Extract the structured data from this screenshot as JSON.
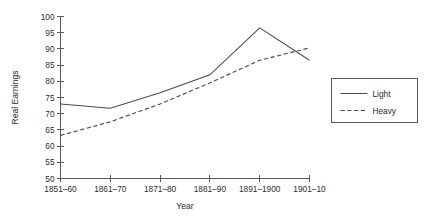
{
  "chart_data": {
    "type": "line",
    "title": "",
    "xlabel": "Year",
    "ylabel": "Real Earnings",
    "categories": [
      "1851–60",
      "1861–70",
      "1871–80",
      "1881–90",
      "1891–1900",
      "1901–10"
    ],
    "ylim": [
      50,
      100
    ],
    "yticks": [
      50,
      55,
      60,
      65,
      70,
      75,
      80,
      85,
      90,
      95,
      100
    ],
    "ytick_labels": [
      "50",
      "55",
      "60",
      "65",
      "70",
      "75",
      "80",
      "85",
      "90",
      "95",
      "100"
    ],
    "grid": false,
    "legend_position": "right",
    "series": [
      {
        "name": "Light",
        "style": "solid",
        "color": "#4a4a4a",
        "values": [
          73.0,
          71.7,
          76.5,
          82.0,
          96.5,
          86.5
        ]
      },
      {
        "name": "Heavy",
        "style": "dashed",
        "color": "#4a4a4a",
        "values": [
          63.3,
          67.5,
          73.0,
          79.5,
          86.5,
          90.3
        ]
      }
    ]
  },
  "legend": {
    "items": [
      {
        "label": "Light",
        "style": "solid"
      },
      {
        "label": "Heavy",
        "style": "dashed"
      }
    ]
  },
  "axes": {
    "x_title": "Year",
    "y_title": "Real Earnings"
  }
}
